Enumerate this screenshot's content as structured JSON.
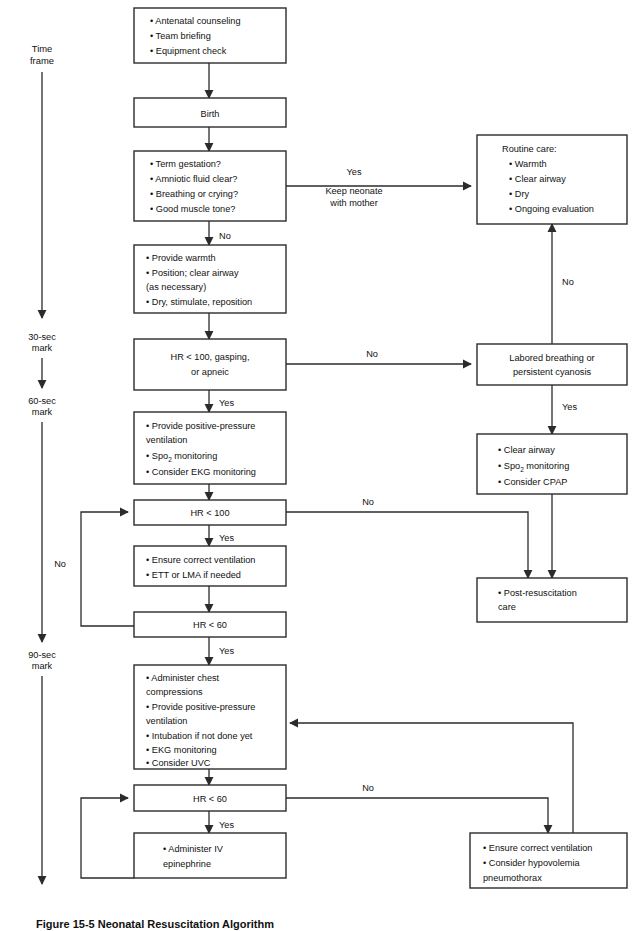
{
  "figure": {
    "caption": "Figure 15-5 Neonatal Resuscitation Algorithm",
    "timeline_title_line1": "Time",
    "timeline_title_line2": "frame",
    "marks": [
      {
        "line1": "30-sec",
        "line2": "mark"
      },
      {
        "line1": "60-sec",
        "line2": "mark"
      },
      {
        "line1": "90-sec",
        "line2": "mark"
      }
    ]
  },
  "colors": {
    "stroke": "#2b2b2b",
    "text": "#111111",
    "background": "#ffffff"
  },
  "nodes": {
    "prep": {
      "lines": [
        "• Antenatal counseling",
        "• Team briefing",
        "• Equipment check"
      ]
    },
    "birth": {
      "lines": [
        "Birth"
      ]
    },
    "assess": {
      "lines": [
        "• Term gestation?",
        "• Amniotic fluid clear?",
        "• Breathing or crying?",
        "• Good muscle tone?"
      ]
    },
    "routine_care": {
      "lines": [
        "Routine care:",
        "• Warmth",
        "• Clear airway",
        "• Dry",
        "• Ongoing evaluation"
      ]
    },
    "warmth": {
      "lines": [
        "• Provide warmth",
        "• Position; clear airway",
        "   (as necessary)",
        "• Dry, stimulate, reposition"
      ]
    },
    "hr100_gasping": {
      "lines": [
        "HR < 100, gasping,",
        "or apneic"
      ]
    },
    "labored": {
      "lines": [
        "Labored breathing or",
        "persistent cyanosis"
      ]
    },
    "ppv": {
      "lines": [
        "• Provide positive-pressure",
        "   ventilation",
        "• Spo2 monitoring",
        "• Consider EKG monitoring"
      ]
    },
    "clear_airway": {
      "lines": [
        "• Clear airway",
        "• Spo2 monitoring",
        "• Consider CPAP"
      ]
    },
    "hr100": {
      "lines": [
        "HR < 100"
      ]
    },
    "ensure_vent": {
      "lines": [
        "• Ensure correct ventilation",
        "• ETT or LMA if needed"
      ]
    },
    "hr60_a": {
      "lines": [
        "HR <  60"
      ]
    },
    "post_resus": {
      "lines": [
        "• Post-resuscitation",
        "   care"
      ]
    },
    "compressions": {
      "lines": [
        "• Administer chest",
        "   compressions",
        "• Provide positive-pressure",
        "   ventilation",
        "• Intubation if not done yet",
        "• EKG monitoring",
        "• Consider UVC"
      ]
    },
    "hr60_b": {
      "lines": [
        "HR <  60"
      ]
    },
    "epi": {
      "lines": [
        "• Administer IV",
        "   epinephrine"
      ]
    },
    "ensure_vent2": {
      "lines": [
        "• Ensure correct ventilation",
        "• Consider hypovolemia",
        "   pneumothorax"
      ]
    }
  },
  "edge_labels": {
    "assess_yes": "Yes",
    "assess_keep_l1": "Keep neonate",
    "assess_keep_l2": "with mother",
    "assess_no": "No",
    "routine_no": "No",
    "hr100gasp_no": "No",
    "hr100gasp_yes": "Yes",
    "labored_yes": "Yes",
    "hr100_no": "No",
    "hr100_yes": "Yes",
    "hr60a_no": "No",
    "hr60a_yes": "Yes",
    "hr60b_no": "No",
    "hr60b_yes": "Yes"
  }
}
